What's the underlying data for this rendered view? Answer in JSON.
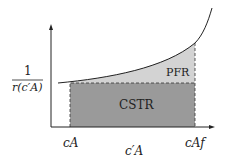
{
  "diagram": {
    "y_label": {
      "numerator": "1",
      "denominator": "r(c′A)"
    },
    "x_label": "c′A",
    "x_ticks": {
      "start": "cA",
      "end": "cAf"
    },
    "regions": {
      "pfr": "PFR",
      "cstr": "CSTR"
    },
    "colors": {
      "cstr_fill": "#9a9a9a",
      "pfr_fill": "#d3d3d3",
      "line": "#222222"
    }
  }
}
